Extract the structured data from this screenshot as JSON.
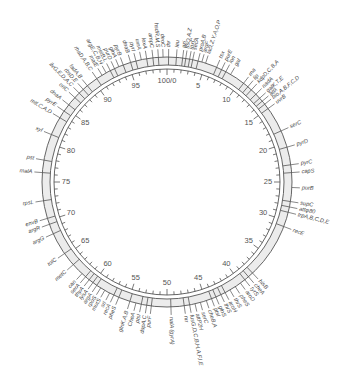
{
  "diagram": {
    "title": "",
    "type": "circular genetic map",
    "center": [
      167,
      182
    ],
    "colors": {
      "line": "#555555",
      "band": "#ececec",
      "text": "#444444",
      "background": "#ffffff"
    },
    "scale": {
      "total_minutes": 100,
      "origin_label": "100/0",
      "major_labels": [
        {
          "min": 0,
          "text": "100/0"
        },
        {
          "min": 5,
          "text": "5"
        },
        {
          "min": 10,
          "text": "10"
        },
        {
          "min": 15,
          "text": "15"
        },
        {
          "min": 20,
          "text": "20"
        },
        {
          "min": 25,
          "text": "25"
        },
        {
          "min": 30,
          "text": "30"
        },
        {
          "min": 35,
          "text": "35"
        },
        {
          "min": 40,
          "text": "40"
        },
        {
          "min": 45,
          "text": "45"
        },
        {
          "min": 50,
          "text": "50"
        },
        {
          "min": 55,
          "text": "55"
        },
        {
          "min": 60,
          "text": "60"
        },
        {
          "min": 65,
          "text": "65"
        },
        {
          "min": 70,
          "text": "70"
        },
        {
          "min": 75,
          "text": "75"
        },
        {
          "min": 80,
          "text": "80"
        },
        {
          "min": 85,
          "text": "85"
        },
        {
          "min": 90,
          "text": "90"
        },
        {
          "min": 95,
          "text": "95"
        }
      ]
    },
    "genes": [
      {
        "min": 0.2,
        "label": "thr"
      },
      {
        "min": 1.2,
        "label": "leu"
      },
      {
        "min": 2.0,
        "label": "azi"
      },
      {
        "min": 2.4,
        "label": "ftsQ,A,Z"
      },
      {
        "min": 2.9,
        "label": "lpxC"
      },
      {
        "min": 3.3,
        "label": "secA"
      },
      {
        "min": 4.0,
        "label": "proA,B"
      },
      {
        "min": 4.5,
        "label": "argF"
      },
      {
        "min": 5.0,
        "label": "lacI,Z,Y,A,O,P"
      },
      {
        "min": 6.5,
        "label": "tsx"
      },
      {
        "min": 7.2,
        "label": "purE"
      },
      {
        "min": 7.8,
        "label": "lon"
      },
      {
        "min": 8.5,
        "label": "gal"
      },
      {
        "min": 10.5,
        "label": "rna"
      },
      {
        "min": 11.2,
        "label": "lip"
      },
      {
        "min": 11.8,
        "label": "kdpD,C,B,A"
      },
      {
        "min": 12.6,
        "label": "nadA"
      },
      {
        "min": 13.3,
        "label": "galK,T,E"
      },
      {
        "min": 13.8,
        "label": "attλ"
      },
      {
        "min": 14.3,
        "label": "bio,A,B,F,C,D"
      },
      {
        "min": 15.0,
        "label": "uvrB"
      },
      {
        "min": 18.3,
        "label": "serC"
      },
      {
        "min": 20.5,
        "label": "pyrD"
      },
      {
        "min": 22.8,
        "label": "pyrC"
      },
      {
        "min": 23.8,
        "label": "capS"
      },
      {
        "min": 25.7,
        "label": "purB"
      },
      {
        "min": 27.5,
        "label": "supC"
      },
      {
        "min": 28.2,
        "label": "attφ80"
      },
      {
        "min": 28.9,
        "label": "trpA,B,C,D,E"
      },
      {
        "min": 30.8,
        "label": "recE"
      },
      {
        "min": 38.0,
        "label": "hisB"
      },
      {
        "min": 38.7,
        "label": "cheA"
      },
      {
        "min": 39.3,
        "label": "tyrS"
      },
      {
        "min": 40.0,
        "label": "aroD"
      },
      {
        "min": 40.8,
        "label": "pheS"
      },
      {
        "min": 41.6,
        "label": "thrS"
      },
      {
        "min": 42.3,
        "label": "aroH"
      },
      {
        "min": 42.9,
        "label": "thrS"
      },
      {
        "min": 43.6,
        "label": "glnS"
      },
      {
        "min": 44.2,
        "label": "ptsI"
      },
      {
        "min": 44.9,
        "label": "cheB,A"
      },
      {
        "min": 45.7,
        "label": "serC"
      },
      {
        "min": 46.4,
        "label": "attP2H"
      },
      {
        "min": 47.1,
        "label": "fusG,D,C,B,H,A,F,I,E"
      },
      {
        "min": 47.8,
        "label": "nrr"
      },
      {
        "min": 49.5,
        "label": "nalA (gyrA)"
      },
      {
        "min": 52.0,
        "label": "purF"
      },
      {
        "min": 52.6,
        "label": "dapA,C"
      },
      {
        "min": 53.3,
        "label": "ptsI"
      },
      {
        "min": 54.0,
        "label": "CheA"
      },
      {
        "min": 54.8,
        "label": "glnK,A,B"
      },
      {
        "min": 56.3,
        "label": "pheS"
      },
      {
        "min": 57.0,
        "label": "recA"
      },
      {
        "min": 57.6,
        "label": "srl"
      },
      {
        "min": 58.3,
        "label": "mutS"
      },
      {
        "min": 58.9,
        "label": "rpoS"
      },
      {
        "min": 59.5,
        "label": "argA"
      },
      {
        "min": 60.1,
        "label": "lysA"
      },
      {
        "min": 60.7,
        "label": "thyA"
      },
      {
        "min": 61.3,
        "label": "serA"
      },
      {
        "min": 61.9,
        "label": "can"
      },
      {
        "min": 63.5,
        "label": "metC"
      },
      {
        "min": 65.3,
        "label": "tolC"
      },
      {
        "min": 68.2,
        "label": "argG"
      },
      {
        "min": 69.5,
        "label": "argR"
      },
      {
        "min": 70.3,
        "label": "envB"
      },
      {
        "min": 72.6,
        "label": "rpsL"
      },
      {
        "min": 76.2,
        "label": "malA"
      },
      {
        "min": 77.8,
        "label": "pst"
      },
      {
        "min": 81.2,
        "label": "xyl"
      },
      {
        "min": 83.6,
        "label": "mtl,C,A,D"
      },
      {
        "min": 84.6,
        "label": "pyrE"
      },
      {
        "min": 85.6,
        "label": "dnaA"
      },
      {
        "min": 86.8,
        "label": "oriC"
      },
      {
        "min": 87.6,
        "label": "ilvG,E,D,A,C"
      },
      {
        "min": 88.3,
        "label": "rbsD,E"
      },
      {
        "min": 89.0,
        "label": "fadA,B"
      },
      {
        "min": 90.5,
        "label": "rhaD,A,B,C"
      },
      {
        "min": 91.3,
        "label": "malE"
      },
      {
        "min": 91.9,
        "label": "argE,C,B,H"
      },
      {
        "min": 92.5,
        "label": "metB,L"
      },
      {
        "min": 93.1,
        "label": "purD"
      },
      {
        "min": 93.7,
        "label": "glnA"
      },
      {
        "min": 94.3,
        "label": "pyrB"
      },
      {
        "min": 95.3,
        "label": "dnaB"
      },
      {
        "min": 96.0,
        "label": "pyrI"
      },
      {
        "min": 96.7,
        "label": "uvrA"
      },
      {
        "min": 97.4,
        "label": "lexA"
      },
      {
        "min": 98.2,
        "label": "ampC"
      },
      {
        "min": 98.9,
        "label": "hsdR,M,S"
      },
      {
        "min": 99.5,
        "label": "deoC"
      }
    ],
    "band_dividers": [
      0.2,
      1.2,
      2.0,
      2.4,
      2.9,
      3.3,
      4.0,
      6.5,
      7.2,
      7.8,
      10.5,
      11.2,
      11.8,
      12.6,
      13.3,
      13.8,
      14.3,
      15.0,
      18.3,
      20.5,
      22.8,
      23.8,
      27.5,
      28.2,
      28.9,
      30.8,
      38.0,
      38.7,
      39.3,
      42.3,
      42.9,
      43.6,
      44.2,
      47.1,
      47.8,
      49.5,
      52.0,
      52.6,
      53.3,
      54.8,
      56.3,
      57.0,
      59.5,
      60.1,
      60.7,
      61.3,
      63.5,
      65.3,
      68.2,
      69.5,
      70.3,
      72.6,
      76.2,
      77.8,
      81.2,
      83.6,
      84.6,
      85.6,
      86.8,
      87.6,
      88.3,
      89.0,
      90.5,
      92.5,
      93.1,
      94.3,
      95.3,
      96.0,
      97.4,
      98.2,
      98.9
    ]
  }
}
